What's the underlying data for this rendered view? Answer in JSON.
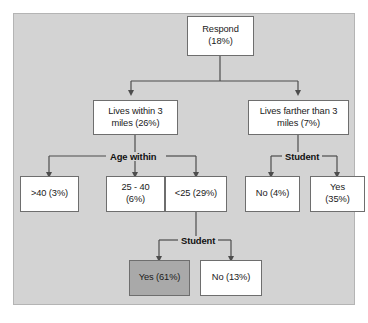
{
  "diagram": {
    "background_color": "#d3d3d3",
    "node_fill": "#ffffff",
    "highlight_fill": "#a9a9a9",
    "line_color": "#4d4d4d",
    "nodes": [
      {
        "id": "respond",
        "label": "Respond\n(18%)",
        "text_line1": "Respond",
        "text_line2": "(18%)",
        "percent": "18%",
        "highlighted": false
      },
      {
        "id": "within3",
        "label": "Lives within 3 miles (26%)",
        "text_line1": "Lives within 3",
        "text_line2": "miles (26%)",
        "percent": "26%",
        "highlighted": false
      },
      {
        "id": "farther3",
        "label": "Lives farther than 3 miles (7%)",
        "text_line1": "Lives farther than 3",
        "text_line2": "miles (7%)",
        "percent": "7%",
        "highlighted": false
      },
      {
        "id": "age_over40",
        "label": ">40 (3%)",
        "text_line1": ">40 (3%)",
        "text_line2": "",
        "percent": "3%",
        "highlighted": false
      },
      {
        "id": "age_25_40",
        "label": "25 - 40 (6%)",
        "text_line1": "25 - 40",
        "text_line2": "(6%)",
        "percent": "6%",
        "highlighted": false
      },
      {
        "id": "age_under25",
        "label": "<25 (29%)",
        "text_line1": "<25 (29%)",
        "text_line2": "",
        "percent": "29%",
        "highlighted": false
      },
      {
        "id": "student_no_far",
        "label": "No (4%)",
        "text_line1": "No (4%)",
        "text_line2": "",
        "percent": "4%",
        "highlighted": false
      },
      {
        "id": "student_yes_far",
        "label": "Yes (35%)",
        "text_line1": "Yes",
        "text_line2": "(35%)",
        "percent": "35%",
        "highlighted": false
      },
      {
        "id": "student_yes_u25",
        "label": "Yes (61%)",
        "text_line1": "Yes (61%)",
        "text_line2": "",
        "percent": "61%",
        "highlighted": true
      },
      {
        "id": "student_no_u25",
        "label": "No (13%)",
        "text_line1": "No (13%)",
        "text_line2": "",
        "percent": "13%",
        "highlighted": false
      }
    ],
    "edge_labels": [
      {
        "id": "age-within-label",
        "text": "Age within"
      },
      {
        "id": "student-right-label",
        "text": "Student"
      },
      {
        "id": "student-lower-label",
        "text": "Student"
      }
    ]
  }
}
